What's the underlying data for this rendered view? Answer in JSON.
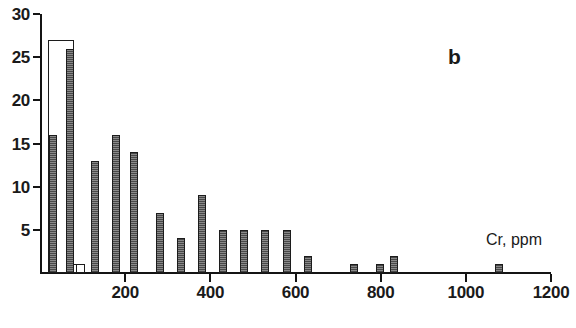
{
  "figure": {
    "panel_label": "b",
    "axis_title": "Cr, ppm",
    "caption": ""
  },
  "chart_data": {
    "type": "bar",
    "title": "",
    "subtitle": "",
    "xlabel": "Cr, ppm",
    "ylabel": "",
    "xlim": [
      0,
      1200
    ],
    "ylim": [
      0,
      30
    ],
    "grid": false,
    "legend": null,
    "annotations": [
      {
        "text": "b",
        "x": 900,
        "y": 27
      },
      {
        "text": "Cr, ppm",
        "x": 1090,
        "y": 5
      }
    ],
    "xticks": [
      0,
      200,
      400,
      600,
      800,
      1000,
      1200
    ],
    "xtick_labels": [
      "",
      "200",
      "400",
      "600",
      "800",
      "1000",
      "1200"
    ],
    "yticks": [
      5,
      10,
      15,
      20,
      25,
      30
    ],
    "ytick_labels": [
      "5",
      "10",
      "15",
      "20",
      "25",
      "30"
    ],
    "bin_width": 25,
    "note": "Histogram of Cr concentration. First bin drawn as hollow (unfilled) outline overlapping a narrow filled bar.",
    "bars": [
      {
        "x": 18,
        "value": 27,
        "style": "hollow",
        "width": 26
      },
      {
        "x": 22,
        "value": 16,
        "style": "filled",
        "width": 8
      },
      {
        "x": 62,
        "value": 26,
        "style": "filled",
        "width": 8
      },
      {
        "x": 72,
        "value": 1,
        "style": "hollow",
        "width": 9
      },
      {
        "x": 85,
        "value": 1,
        "style": "hollow",
        "width": 9
      },
      {
        "x": 120,
        "value": 13,
        "style": "filled",
        "width": 8
      },
      {
        "x": 168,
        "value": 16,
        "style": "filled",
        "width": 8
      },
      {
        "x": 212,
        "value": 14,
        "style": "filled",
        "width": 8
      },
      {
        "x": 272,
        "value": 7,
        "style": "filled",
        "width": 8
      },
      {
        "x": 322,
        "value": 4,
        "style": "filled",
        "width": 8
      },
      {
        "x": 372,
        "value": 9,
        "style": "filled",
        "width": 8
      },
      {
        "x": 420,
        "value": 5,
        "style": "filled",
        "width": 8
      },
      {
        "x": 470,
        "value": 5,
        "style": "filled",
        "width": 8
      },
      {
        "x": 520,
        "value": 5,
        "style": "filled",
        "width": 8
      },
      {
        "x": 570,
        "value": 5,
        "style": "filled",
        "width": 8
      },
      {
        "x": 620,
        "value": 2,
        "style": "filled",
        "width": 8
      },
      {
        "x": 728,
        "value": 1,
        "style": "filled",
        "width": 8
      },
      {
        "x": 790,
        "value": 1,
        "style": "filled",
        "width": 8
      },
      {
        "x": 822,
        "value": 2,
        "style": "filled",
        "width": 8
      },
      {
        "x": 1068,
        "value": 1,
        "style": "filled",
        "width": 8
      }
    ]
  }
}
